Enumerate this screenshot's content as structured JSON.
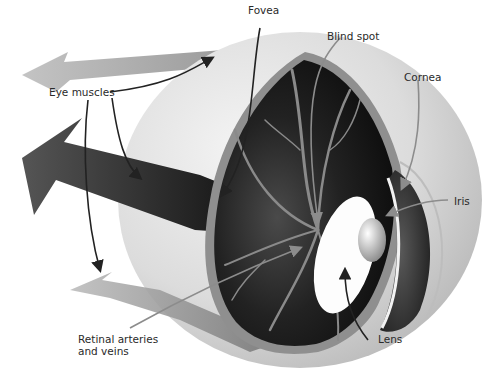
{
  "diagram": {
    "labels": {
      "fovea": "Fovea",
      "blind_spot": "Blind spot",
      "eye_muscles": "Eye muscles",
      "cornea": "Cornea",
      "iris": "Iris",
      "retinal_line1": "Retinal arteries",
      "retinal_line2": "and veins",
      "lens": "Lens"
    },
    "colors": {
      "background": "#ffffff",
      "sclera": "#d9d9d9",
      "interior": "#151515",
      "muscle_dark": "#3a3a3a",
      "muscle_light": "#9a9a9a",
      "vessels": "#8a8a8a",
      "leader_dark": "#222222",
      "leader_light": "#8c8c8c"
    }
  }
}
